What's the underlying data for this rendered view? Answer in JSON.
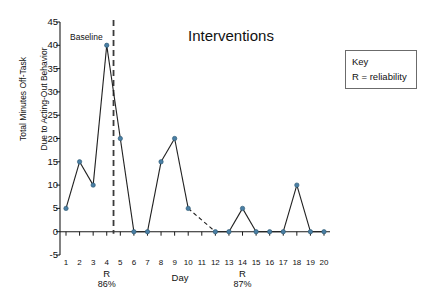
{
  "chart_data": {
    "type": "line",
    "title": "",
    "xlabel": "Day",
    "ylabel": "Total Minutes Off-Task\nDue to Acting-Out Behavior",
    "x": [
      1,
      2,
      3,
      4,
      5,
      6,
      7,
      8,
      9,
      10,
      11,
      12,
      13,
      14,
      15,
      16,
      17,
      18,
      19,
      20
    ],
    "values": [
      5,
      15,
      10,
      40,
      20,
      0,
      0,
      15,
      20,
      5,
      null,
      0,
      0,
      5,
      0,
      0,
      0,
      10,
      0,
      0
    ],
    "missing_x": [
      11
    ],
    "ylim": [
      -5,
      45
    ],
    "yticks": [
      -5,
      0,
      5,
      10,
      15,
      20,
      25,
      30,
      35,
      40,
      45
    ],
    "xticks": [
      "1",
      "2",
      "3",
      "4",
      "5",
      "6",
      "7",
      "8",
      "9",
      "10",
      "11",
      "12",
      "13",
      "14",
      "15",
      "16",
      "17",
      "18",
      "19",
      "20"
    ],
    "grid": false,
    "legend_position": "right",
    "marker_color": "#4a7fa5",
    "line_color": "#1f1f1f",
    "series_name": "Total minutes off-task"
  },
  "annotations": {
    "phase_line_between": "4 and 5",
    "phases": [
      {
        "name": "baseline-label",
        "label": "Baseline"
      },
      {
        "name": "interventions-label",
        "label": "Interventions"
      }
    ],
    "reliability_marks": [
      {
        "day": 4,
        "symbol": "R",
        "percent": "86%"
      },
      {
        "day": 14,
        "symbol": "R",
        "percent": "87%"
      }
    ]
  },
  "key": {
    "title": "Key",
    "entries": [
      "R = reliability"
    ]
  },
  "axis": {
    "y_label_line1": "Total Minutes Off-Task",
    "y_label_line2": "Due to Acting-Out Behavior",
    "x_label": "Day"
  }
}
